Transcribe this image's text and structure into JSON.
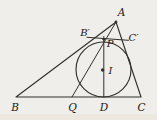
{
  "figure": {
    "type": "geometry-diagram",
    "background_color": "#f0eeea",
    "paper_edge_color": "#e9e3d7",
    "stroke_color": "#33312d",
    "label_color": "#191815",
    "labels": {
      "a": "A",
      "b": "B",
      "c": "C",
      "d": "D",
      "q": "Q",
      "p": "P",
      "i": "I",
      "b_prime": "B′",
      "c_prime": "C′"
    }
  }
}
